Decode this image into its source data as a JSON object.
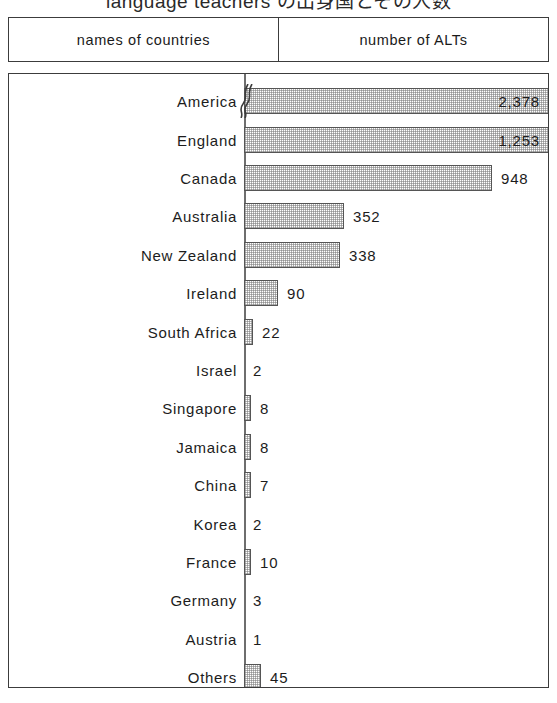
{
  "title": "language teachers の出身国とその人数",
  "header": {
    "col_left": "names of countries",
    "col_right": "number of ALTs"
  },
  "chart_data": {
    "type": "bar",
    "orientation": "horizontal",
    "title": "language teachers の出身国とその人数",
    "xlabel": "number of ALTs",
    "ylabel": "names of countries",
    "grid": false,
    "legend": null,
    "axis_break": {
      "series_index": 0,
      "note": "scale break drawn on the America bar"
    },
    "categories": [
      "America",
      "England",
      "Canada",
      "Australia",
      "New Zealand",
      "Ireland",
      "South Africa",
      "Israel",
      "Singapore",
      "Jamaica",
      "China",
      "Korea",
      "France",
      "Germany",
      "Austria",
      "Others"
    ],
    "values": [
      2378,
      1253,
      948,
      352,
      338,
      90,
      22,
      2,
      8,
      8,
      7,
      2,
      10,
      3,
      1,
      45
    ],
    "value_labels": [
      "2,378",
      "1,253",
      "948",
      "352",
      "338",
      "90",
      "22",
      "2",
      "8",
      "8",
      "7",
      "2",
      "10",
      "3",
      "1",
      "45"
    ]
  },
  "rows": [
    {
      "label": "America",
      "value_label": "2,378",
      "bar_px": 314,
      "label_inside": true,
      "broken": true
    },
    {
      "label": "England",
      "value_label": "1,253",
      "bar_px": 314,
      "label_inside": true,
      "broken": false
    },
    {
      "label": "Canada",
      "value_label": "948",
      "bar_px": 248,
      "label_inside": false,
      "broken": false
    },
    {
      "label": "Australia",
      "value_label": "352",
      "bar_px": 100,
      "label_inside": false,
      "broken": false
    },
    {
      "label": "New Zealand",
      "value_label": "338",
      "bar_px": 96,
      "label_inside": false,
      "broken": false
    },
    {
      "label": "Ireland",
      "value_label": "90",
      "bar_px": 34,
      "label_inside": false,
      "broken": false
    },
    {
      "label": "South Africa",
      "value_label": "22",
      "bar_px": 9,
      "label_inside": false,
      "broken": false
    },
    {
      "label": "Israel",
      "value_label": "2",
      "bar_px": 0,
      "label_inside": false,
      "broken": false
    },
    {
      "label": "Singapore",
      "value_label": "8",
      "bar_px": 7,
      "label_inside": false,
      "broken": false
    },
    {
      "label": "Jamaica",
      "value_label": "8",
      "bar_px": 7,
      "label_inside": false,
      "broken": false
    },
    {
      "label": "China",
      "value_label": "7",
      "bar_px": 7,
      "label_inside": false,
      "broken": false
    },
    {
      "label": "Korea",
      "value_label": "2",
      "bar_px": 0,
      "label_inside": false,
      "broken": false
    },
    {
      "label": "France",
      "value_label": "10",
      "bar_px": 7,
      "label_inside": false,
      "broken": false
    },
    {
      "label": "Germany",
      "value_label": "3",
      "bar_px": 0,
      "label_inside": false,
      "broken": false
    },
    {
      "label": "Austria",
      "value_label": "1",
      "bar_px": 0,
      "label_inside": false,
      "broken": false
    },
    {
      "label": "Others",
      "value_label": "45",
      "bar_px": 17,
      "label_inside": false,
      "broken": false
    }
  ]
}
